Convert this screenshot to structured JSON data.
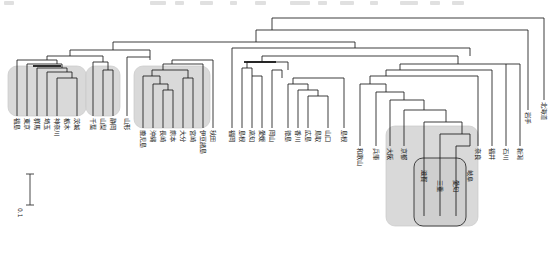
{
  "figure": {
    "type": "dendrogram",
    "orientation": "top-down",
    "title": "",
    "scale_bar": {
      "label": "0.1",
      "length_units": 0.1
    },
    "background": "#ffffff",
    "line_color": "#1a1a1a",
    "highlight_fill": "#d9d9d9",
    "highlight_stroke": "#bdbdbd"
  },
  "clusters": [
    {
      "id": "kanto-group",
      "name": "Kanto cluster"
    },
    {
      "id": "chuo-group",
      "name": "Chubu cluster"
    },
    {
      "id": "kyushu-group",
      "name": "Kyushu / Okinawa cluster"
    },
    {
      "id": "kinki-group",
      "name": "Kinki cluster"
    },
    {
      "id": "tokai-group",
      "name": "Tokai inner cluster"
    }
  ],
  "leaves": [
    {
      "index": 0,
      "label": "福島",
      "romaji": "Fukushima",
      "x": 17,
      "group": "kanto-group"
    },
    {
      "index": 1,
      "label": "東京",
      "romaji": "Tokyo",
      "x": 27,
      "group": "kanto-group"
    },
    {
      "index": 2,
      "label": "群馬",
      "romaji": "Gunma",
      "x": 37,
      "group": "kanto-group"
    },
    {
      "index": 3,
      "label": "埼玉",
      "romaji": "Saitama",
      "x": 47,
      "group": "kanto-group"
    },
    {
      "index": 4,
      "label": "神奈川",
      "romaji": "Kanagawa",
      "x": 57,
      "group": "kanto-group"
    },
    {
      "index": 5,
      "label": "栃木",
      "romaji": "Tochigi",
      "x": 67,
      "group": "kanto-group"
    },
    {
      "index": 6,
      "label": "茨城",
      "romaji": "Ibaraki",
      "x": 77,
      "group": "kanto-group"
    },
    {
      "index": 7,
      "label": "千葉",
      "romaji": "Chiba",
      "x": 93,
      "group": "chuo-group"
    },
    {
      "index": 8,
      "label": "山梨",
      "romaji": "Yamanashi",
      "x": 103,
      "group": "chuo-group"
    },
    {
      "index": 9,
      "label": "静岡",
      "romaji": "Shizuoka",
      "x": 113,
      "group": "chuo-group"
    },
    {
      "index": 10,
      "label": "山形",
      "romaji": "Yamagata",
      "x": 127,
      "group": null
    },
    {
      "index": 11,
      "label": "鹿児島",
      "romaji": "Kagoshima",
      "x": 143,
      "group": "kyushu-group"
    },
    {
      "index": 12,
      "label": "沖縄",
      "romaji": "Okinawa",
      "x": 153,
      "group": "kyushu-group"
    },
    {
      "index": 13,
      "label": "長崎",
      "romaji": "Nagasaki",
      "x": 163,
      "group": "kyushu-group"
    },
    {
      "index": 14,
      "label": "熊本",
      "romaji": "Kumamoto",
      "x": 173,
      "group": "kyushu-group"
    },
    {
      "index": 15,
      "label": "大分",
      "romaji": "Oita",
      "x": 183,
      "group": "kyushu-group"
    },
    {
      "index": 16,
      "label": "宮崎",
      "romaji": "Miyazaki",
      "x": 193,
      "group": "kyushu-group"
    },
    {
      "index": 17,
      "label": "伊豆諸島",
      "romaji": "Izu-shoto",
      "x": 203,
      "group": "kyushu-group"
    },
    {
      "index": 18,
      "label": "秋田",
      "romaji": "Akita",
      "x": 213,
      "group": null
    },
    {
      "index": 19,
      "label": "福岡",
      "romaji": "Fukuoka",
      "x": 232,
      "group": null
    },
    {
      "index": 20,
      "label": "島根",
      "romaji": "Shimane",
      "x": 242,
      "group": null
    },
    {
      "index": 21,
      "label": "高知",
      "romaji": "Kochi",
      "x": 252,
      "group": null
    },
    {
      "index": 22,
      "label": "愛媛",
      "romaji": "Ehime",
      "x": 262,
      "group": null
    },
    {
      "index": 23,
      "label": "岡山",
      "romaji": "Okayama",
      "x": 272,
      "group": null
    },
    {
      "index": 24,
      "label": "徳島",
      "romaji": "Tokushima",
      "x": 288,
      "group": null
    },
    {
      "index": 25,
      "label": "香川",
      "romaji": "Kagawa",
      "x": 298,
      "group": null
    },
    {
      "index": 26,
      "label": "広島",
      "romaji": "Hiroshima",
      "x": 308,
      "group": null
    },
    {
      "index": 27,
      "label": "鳥取",
      "romaji": "Tottori",
      "x": 318,
      "group": null
    },
    {
      "index": 28,
      "label": "山口",
      "romaji": "Yamaguchi",
      "x": 328,
      "group": null
    },
    {
      "index": 29,
      "label": "島根",
      "romaji": "Shimane",
      "x": 344,
      "group": null
    },
    {
      "index": 30,
      "label": "和歌山",
      "romaji": "Wakayama",
      "x": 360,
      "group": null
    },
    {
      "index": 31,
      "label": "兵庫",
      "romaji": "Hyogo",
      "x": 376,
      "group": null
    },
    {
      "index": 32,
      "label": "大阪",
      "romaji": "Osaka",
      "x": 390,
      "group": null
    },
    {
      "index": 33,
      "label": "京都",
      "romaji": "Kyoto",
      "x": 404,
      "group": "kinki-group"
    },
    {
      "index": 34,
      "label": "滋賀",
      "romaji": "Shiga",
      "x": 424,
      "group": "tokai-group"
    },
    {
      "index": 35,
      "label": "三重",
      "romaji": "Mie",
      "x": 440,
      "group": "tokai-group"
    },
    {
      "index": 36,
      "label": "愛知",
      "romaji": "Aichi",
      "x": 456,
      "group": "tokai-group"
    },
    {
      "index": 37,
      "label": "岐阜",
      "romaji": "Gifu",
      "x": 470,
      "group": "tokai-group"
    },
    {
      "index": 38,
      "label": "奈良",
      "romaji": "Nara",
      "x": 478,
      "group": null
    },
    {
      "index": 39,
      "label": "福井",
      "romaji": "Fukui",
      "x": 492,
      "group": null
    },
    {
      "index": 40,
      "label": "石川",
      "romaji": "Ishikawa",
      "x": 506,
      "group": null
    },
    {
      "index": 41,
      "label": "新潟",
      "romaji": "Niigata",
      "x": 520,
      "group": null
    },
    {
      "index": 42,
      "label": "岩手",
      "romaji": "Iwate",
      "x": 528,
      "group": null
    },
    {
      "index": 43,
      "label": "北海道",
      "romaji": "Hokkaido",
      "x": 544,
      "group": null
    }
  ],
  "axis": {
    "note": "branch height increases upward; no numeric axis drawn"
  }
}
